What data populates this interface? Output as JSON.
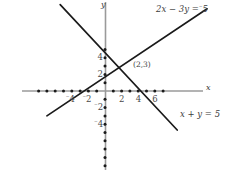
{
  "figure": {
    "axis_labels": {
      "x": "x",
      "y": "y"
    },
    "colors": {
      "axis": "#9a9a9a",
      "line": "#1a1a1a",
      "dot": "#1a1a1a",
      "text": "#3a3a3a"
    }
  },
  "axes": {
    "origin_px": {
      "x": 105,
      "y": 91
    },
    "unit_px": 8.3,
    "x_range": [
      -10,
      12
    ],
    "y_range": [
      -10,
      11
    ],
    "x_tick_labels": [
      {
        "value": -4,
        "text": "4",
        "negative": true
      },
      {
        "value": -2,
        "text": "2",
        "negative": true
      },
      {
        "value": 2,
        "text": "2",
        "negative": false
      },
      {
        "value": 4,
        "text": "4",
        "negative": false
      },
      {
        "value": 6,
        "text": "6",
        "negative": false
      }
    ],
    "y_tick_labels": [
      {
        "value": 4,
        "text": "4",
        "negative": false
      },
      {
        "value": 2,
        "text": "2",
        "negative": false
      },
      {
        "value": -2,
        "text": "2",
        "negative": true
      },
      {
        "value": -4,
        "text": "4",
        "negative": true
      }
    ]
  },
  "chart_data": {
    "type": "line",
    "title": "",
    "xlabel": "x",
    "ylabel": "y",
    "xlim": [
      -10,
      12
    ],
    "ylim": [
      -10,
      11
    ],
    "grid": false,
    "legend": "inline-labels",
    "series": [
      {
        "name": "2x - 3y = -5",
        "label": "2x − 3y = ⁻5",
        "label_parts": {
          "lhs": "2x − 3y =",
          "rhs": "5",
          "rhs_negative": true
        },
        "slope": 0.6667,
        "intercept": 1.6667,
        "endpoints": [
          {
            "x": -7.0,
            "y": -3.0
          },
          {
            "x": 12.3,
            "y": 9.9
          }
        ],
        "label_position_px": {
          "x": 156,
          "y": 9
        }
      },
      {
        "name": "x + y = 5",
        "label": "x + y = 5",
        "label_parts": {
          "lhs": "x + y =",
          "rhs": "5",
          "rhs_negative": false
        },
        "slope": -1.0,
        "intercept": 5.0,
        "endpoints": [
          {
            "x": -5.4,
            "y": 10.4
          },
          {
            "x": 8.7,
            "y": -4.7
          }
        ],
        "label_position_px": {
          "x": 180,
          "y": 113
        }
      }
    ],
    "annotations": [
      {
        "name": "intersection-point",
        "text": "(2,3)",
        "x": 2,
        "y": 3,
        "label_position_px": {
          "x": 133,
          "y": 65
        }
      }
    ],
    "x_axis_dots": [
      -8,
      -7,
      -6,
      -5,
      -4,
      -3,
      -2,
      -1,
      1,
      2,
      3,
      4,
      5,
      6,
      7
    ],
    "y_axis_dots": [
      -9,
      -8,
      -7,
      -6,
      -5,
      -4,
      -3,
      -2,
      -1,
      1,
      2,
      3,
      4,
      5
    ]
  }
}
